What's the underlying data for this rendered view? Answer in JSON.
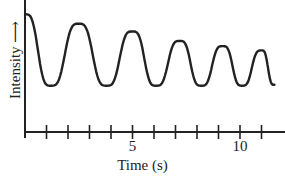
{
  "chart_data": {
    "type": "line",
    "title": "",
    "xlabel": "Time (s)",
    "ylabel": "Intensity",
    "ylabel_arrow": true,
    "x_tick_labels": [
      {
        "value": 5,
        "label": "5"
      },
      {
        "value": 10,
        "label": "10"
      }
    ],
    "x_ticks": [
      0,
      1,
      2,
      3,
      4,
      5,
      6,
      7,
      8,
      9,
      10,
      11
    ],
    "xlim": [
      0,
      11.6
    ],
    "ylim": [
      0,
      1
    ],
    "grid": false,
    "legend": null,
    "series": [
      {
        "name": "Intensity",
        "description": "Damped oscillation with decreasing period; peaks get closer together and lower over time",
        "peaks": [
          {
            "t": 0.0,
            "intensity": 0.95
          },
          {
            "t": 2.5,
            "intensity": 0.84
          },
          {
            "t": 5.0,
            "intensity": 0.75
          },
          {
            "t": 7.2,
            "intensity": 0.64
          },
          {
            "t": 9.2,
            "intensity": 0.58
          },
          {
            "t": 11.0,
            "intensity": 0.53
          }
        ],
        "troughs": [
          {
            "t": 1.2,
            "intensity": 0.12
          },
          {
            "t": 3.8,
            "intensity": 0.12
          },
          {
            "t": 6.1,
            "intensity": 0.12
          },
          {
            "t": 8.2,
            "intensity": 0.12
          },
          {
            "t": 10.1,
            "intensity": 0.12
          },
          {
            "t": 11.6,
            "intensity": 0.13
          }
        ]
      }
    ]
  }
}
